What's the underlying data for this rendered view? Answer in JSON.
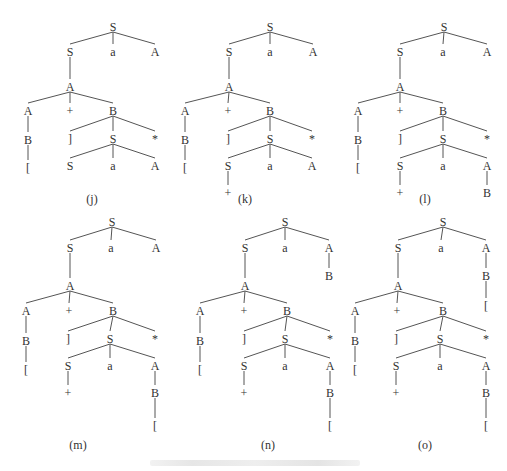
{
  "figure": {
    "caption_text": ""
  },
  "trees": [
    {
      "id": "j",
      "label": "(j)",
      "label_pos": [
        92,
        203
      ],
      "nodes": [
        {
          "id": "n0",
          "sym": "S",
          "x": 113,
          "y": 27
        },
        {
          "id": "n1",
          "sym": "S",
          "x": 70,
          "y": 52,
          "parent": "n0"
        },
        {
          "id": "n2",
          "sym": "a",
          "x": 113,
          "y": 52,
          "parent": "n0"
        },
        {
          "id": "n3",
          "sym": "A",
          "x": 155,
          "y": 52,
          "parent": "n0"
        },
        {
          "id": "n4",
          "sym": "A",
          "x": 70,
          "y": 87,
          "parent": "n1"
        },
        {
          "id": "n5",
          "sym": "A",
          "x": 28,
          "y": 111,
          "parent": "n4"
        },
        {
          "id": "n6",
          "sym": "+",
          "x": 70,
          "y": 111,
          "parent": "n4"
        },
        {
          "id": "n7",
          "sym": "B",
          "x": 113,
          "y": 111,
          "parent": "n4"
        },
        {
          "id": "n8",
          "sym": "B",
          "x": 28,
          "y": 140,
          "parent": "n5"
        },
        {
          "id": "n9",
          "sym": "[",
          "x": 28,
          "y": 168,
          "parent": "n8"
        },
        {
          "id": "n10",
          "sym": "]",
          "x": 70,
          "y": 139,
          "parent": "n7"
        },
        {
          "id": "n11",
          "sym": "S",
          "x": 113,
          "y": 139,
          "parent": "n7"
        },
        {
          "id": "n12",
          "sym": "*",
          "x": 155,
          "y": 139,
          "parent": "n7"
        },
        {
          "id": "n13",
          "sym": "S",
          "x": 70,
          "y": 166,
          "parent": "n11"
        },
        {
          "id": "n14",
          "sym": "a",
          "x": 113,
          "y": 166,
          "parent": "n11"
        },
        {
          "id": "n15",
          "sym": "A",
          "x": 155,
          "y": 166,
          "parent": "n11"
        }
      ]
    },
    {
      "id": "k",
      "label": "(k)",
      "label_pos": [
        245,
        203
      ],
      "nodes": [
        {
          "id": "n0",
          "sym": "S",
          "x": 270,
          "y": 27
        },
        {
          "id": "n1",
          "sym": "S",
          "x": 229,
          "y": 52,
          "parent": "n0"
        },
        {
          "id": "n2",
          "sym": "a",
          "x": 270,
          "y": 52,
          "parent": "n0"
        },
        {
          "id": "n3",
          "sym": "A",
          "x": 313,
          "y": 52,
          "parent": "n0"
        },
        {
          "id": "n4",
          "sym": "A",
          "x": 229,
          "y": 87,
          "parent": "n1"
        },
        {
          "id": "n5",
          "sym": "A",
          "x": 185,
          "y": 111,
          "parent": "n4"
        },
        {
          "id": "n6",
          "sym": "+",
          "x": 228,
          "y": 111,
          "parent": "n4"
        },
        {
          "id": "n7",
          "sym": "B",
          "x": 270,
          "y": 111,
          "parent": "n4"
        },
        {
          "id": "n8",
          "sym": "B",
          "x": 185,
          "y": 140,
          "parent": "n5"
        },
        {
          "id": "n9",
          "sym": "[",
          "x": 185,
          "y": 168,
          "parent": "n8"
        },
        {
          "id": "n10",
          "sym": "]",
          "x": 228,
          "y": 139,
          "parent": "n7"
        },
        {
          "id": "n11",
          "sym": "S",
          "x": 270,
          "y": 139,
          "parent": "n7"
        },
        {
          "id": "n12",
          "sym": "*",
          "x": 312,
          "y": 139,
          "parent": "n7"
        },
        {
          "id": "n13",
          "sym": "S",
          "x": 228,
          "y": 166,
          "parent": "n11"
        },
        {
          "id": "n14",
          "sym": "a",
          "x": 270,
          "y": 166,
          "parent": "n11"
        },
        {
          "id": "n15",
          "sym": "A",
          "x": 312,
          "y": 166,
          "parent": "n11"
        },
        {
          "id": "n16",
          "sym": "+",
          "x": 228,
          "y": 193,
          "parent": "n13"
        }
      ]
    },
    {
      "id": "l",
      "label": "(l)",
      "label_pos": [
        425,
        203
      ],
      "nodes": [
        {
          "id": "n0",
          "sym": "S",
          "x": 444,
          "y": 27
        },
        {
          "id": "n1",
          "sym": "S",
          "x": 400,
          "y": 52,
          "parent": "n0"
        },
        {
          "id": "n2",
          "sym": "a",
          "x": 443,
          "y": 52,
          "parent": "n0"
        },
        {
          "id": "n3",
          "sym": "A",
          "x": 487,
          "y": 52,
          "parent": "n0"
        },
        {
          "id": "n4",
          "sym": "A",
          "x": 400,
          "y": 87,
          "parent": "n1"
        },
        {
          "id": "n5",
          "sym": "A",
          "x": 358,
          "y": 111,
          "parent": "n4"
        },
        {
          "id": "n6",
          "sym": "+",
          "x": 400,
          "y": 111,
          "parent": "n4"
        },
        {
          "id": "n7",
          "sym": "B",
          "x": 443,
          "y": 111,
          "parent": "n4"
        },
        {
          "id": "n8",
          "sym": "B",
          "x": 358,
          "y": 140,
          "parent": "n5"
        },
        {
          "id": "n9",
          "sym": "[",
          "x": 358,
          "y": 168,
          "parent": "n8"
        },
        {
          "id": "n10",
          "sym": "]",
          "x": 400,
          "y": 139,
          "parent": "n7"
        },
        {
          "id": "n11",
          "sym": "S",
          "x": 443,
          "y": 139,
          "parent": "n7"
        },
        {
          "id": "n12",
          "sym": "*",
          "x": 487,
          "y": 139,
          "parent": "n7"
        },
        {
          "id": "n13",
          "sym": "S",
          "x": 400,
          "y": 166,
          "parent": "n11"
        },
        {
          "id": "n14",
          "sym": "a",
          "x": 443,
          "y": 166,
          "parent": "n11"
        },
        {
          "id": "n15",
          "sym": "A",
          "x": 487,
          "y": 166,
          "parent": "n11"
        },
        {
          "id": "n16",
          "sym": "+",
          "x": 400,
          "y": 193,
          "parent": "n13"
        },
        {
          "id": "n17",
          "sym": "B",
          "x": 487,
          "y": 193,
          "parent": "n15"
        }
      ]
    },
    {
      "id": "m",
      "label": "(m)",
      "label_pos": [
        78,
        449
      ],
      "nodes": [
        {
          "id": "n0",
          "sym": "S",
          "x": 112,
          "y": 222
        },
        {
          "id": "n1",
          "sym": "S",
          "x": 70,
          "y": 248,
          "parent": "n0"
        },
        {
          "id": "n2",
          "sym": "a",
          "x": 111,
          "y": 248,
          "parent": "n0"
        },
        {
          "id": "n3",
          "sym": "A",
          "x": 156,
          "y": 248,
          "parent": "n0"
        },
        {
          "id": "n4",
          "sym": "A",
          "x": 70,
          "y": 286,
          "parent": "n1"
        },
        {
          "id": "n5",
          "sym": "A",
          "x": 26,
          "y": 311,
          "parent": "n4"
        },
        {
          "id": "n6",
          "sym": "+",
          "x": 69,
          "y": 311,
          "parent": "n4"
        },
        {
          "id": "n7",
          "sym": "B",
          "x": 113,
          "y": 311,
          "parent": "n4"
        },
        {
          "id": "n8",
          "sym": "B",
          "x": 26,
          "y": 341,
          "parent": "n5"
        },
        {
          "id": "n9",
          "sym": "[",
          "x": 26,
          "y": 370,
          "parent": "n8"
        },
        {
          "id": "n10",
          "sym": "]",
          "x": 68,
          "y": 339,
          "parent": "n7"
        },
        {
          "id": "n11",
          "sym": "S",
          "x": 110,
          "y": 339,
          "parent": "n7"
        },
        {
          "id": "n12",
          "sym": "*",
          "x": 155,
          "y": 339,
          "parent": "n7"
        },
        {
          "id": "n13",
          "sym": "S",
          "x": 68,
          "y": 366,
          "parent": "n11"
        },
        {
          "id": "n14",
          "sym": "a",
          "x": 110,
          "y": 366,
          "parent": "n11"
        },
        {
          "id": "n15",
          "sym": "A",
          "x": 155,
          "y": 366,
          "parent": "n11"
        },
        {
          "id": "n16",
          "sym": "+",
          "x": 68,
          "y": 393,
          "parent": "n13"
        },
        {
          "id": "n17",
          "sym": "B",
          "x": 155,
          "y": 393,
          "parent": "n15"
        },
        {
          "id": "n18",
          "sym": "[",
          "x": 155,
          "y": 426,
          "parent": "n17"
        }
      ]
    },
    {
      "id": "n",
      "label": "(n)",
      "label_pos": [
        268,
        449
      ],
      "nodes": [
        {
          "id": "n0",
          "sym": "S",
          "x": 285,
          "y": 222
        },
        {
          "id": "n1",
          "sym": "S",
          "x": 245,
          "y": 248,
          "parent": "n0"
        },
        {
          "id": "n2",
          "sym": "a",
          "x": 285,
          "y": 248,
          "parent": "n0"
        },
        {
          "id": "n3",
          "sym": "A",
          "x": 329,
          "y": 248,
          "parent": "n0"
        },
        {
          "id": "n19",
          "sym": "B",
          "x": 329,
          "y": 276,
          "parent": "n3"
        },
        {
          "id": "n4",
          "sym": "A",
          "x": 245,
          "y": 286,
          "parent": "n1"
        },
        {
          "id": "n5",
          "sym": "A",
          "x": 200,
          "y": 311,
          "parent": "n4"
        },
        {
          "id": "n6",
          "sym": "+",
          "x": 244,
          "y": 311,
          "parent": "n4"
        },
        {
          "id": "n7",
          "sym": "B",
          "x": 287,
          "y": 311,
          "parent": "n4"
        },
        {
          "id": "n8",
          "sym": "B",
          "x": 200,
          "y": 341,
          "parent": "n5"
        },
        {
          "id": "n9",
          "sym": "[",
          "x": 200,
          "y": 370,
          "parent": "n8"
        },
        {
          "id": "n10",
          "sym": "]",
          "x": 244,
          "y": 339,
          "parent": "n7"
        },
        {
          "id": "n11",
          "sym": "S",
          "x": 285,
          "y": 339,
          "parent": "n7"
        },
        {
          "id": "n12",
          "sym": "*",
          "x": 330,
          "y": 339,
          "parent": "n7"
        },
        {
          "id": "n13",
          "sym": "S",
          "x": 244,
          "y": 366,
          "parent": "n11"
        },
        {
          "id": "n14",
          "sym": "a",
          "x": 285,
          "y": 366,
          "parent": "n11"
        },
        {
          "id": "n15",
          "sym": "A",
          "x": 330,
          "y": 366,
          "parent": "n11"
        },
        {
          "id": "n16",
          "sym": "+",
          "x": 244,
          "y": 393,
          "parent": "n13"
        },
        {
          "id": "n17",
          "sym": "B",
          "x": 330,
          "y": 393,
          "parent": "n15"
        },
        {
          "id": "n18",
          "sym": "[",
          "x": 330,
          "y": 426,
          "parent": "n17"
        }
      ]
    },
    {
      "id": "o",
      "label": "(o)",
      "label_pos": [
        425,
        449
      ],
      "nodes": [
        {
          "id": "n0",
          "sym": "S",
          "x": 443,
          "y": 222
        },
        {
          "id": "n1",
          "sym": "S",
          "x": 398,
          "y": 248,
          "parent": "n0"
        },
        {
          "id": "n2",
          "sym": "a",
          "x": 441,
          "y": 248,
          "parent": "n0"
        },
        {
          "id": "n3",
          "sym": "A",
          "x": 486,
          "y": 248,
          "parent": "n0"
        },
        {
          "id": "n19",
          "sym": "B",
          "x": 486,
          "y": 276,
          "parent": "n3"
        },
        {
          "id": "n20",
          "sym": "[",
          "x": 486,
          "y": 306,
          "parent": "n19"
        },
        {
          "id": "n4",
          "sym": "A",
          "x": 398,
          "y": 286,
          "parent": "n1"
        },
        {
          "id": "n5",
          "sym": "A",
          "x": 355,
          "y": 311,
          "parent": "n4"
        },
        {
          "id": "n6",
          "sym": "+",
          "x": 397,
          "y": 311,
          "parent": "n4"
        },
        {
          "id": "n7",
          "sym": "B",
          "x": 443,
          "y": 311,
          "parent": "n4"
        },
        {
          "id": "n8",
          "sym": "B",
          "x": 355,
          "y": 341,
          "parent": "n5"
        },
        {
          "id": "n9",
          "sym": "[",
          "x": 355,
          "y": 370,
          "parent": "n8"
        },
        {
          "id": "n10",
          "sym": "]",
          "x": 396,
          "y": 339,
          "parent": "n7"
        },
        {
          "id": "n11",
          "sym": "S",
          "x": 440,
          "y": 339,
          "parent": "n7"
        },
        {
          "id": "n12",
          "sym": "*",
          "x": 486,
          "y": 339,
          "parent": "n7"
        },
        {
          "id": "n13",
          "sym": "S",
          "x": 396,
          "y": 366,
          "parent": "n11"
        },
        {
          "id": "n14",
          "sym": "a",
          "x": 440,
          "y": 366,
          "parent": "n11"
        },
        {
          "id": "n15",
          "sym": "A",
          "x": 486,
          "y": 366,
          "parent": "n11"
        },
        {
          "id": "n16",
          "sym": "+",
          "x": 396,
          "y": 393,
          "parent": "n13"
        },
        {
          "id": "n17",
          "sym": "B",
          "x": 486,
          "y": 393,
          "parent": "n15"
        },
        {
          "id": "n18",
          "sym": "[",
          "x": 486,
          "y": 426,
          "parent": "n17"
        }
      ]
    }
  ]
}
